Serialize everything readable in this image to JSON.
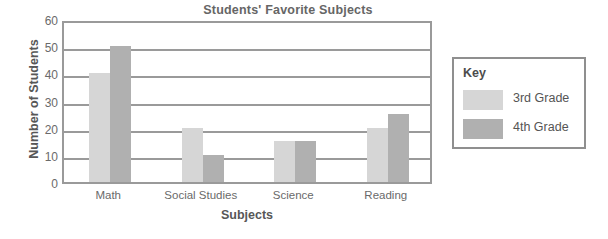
{
  "chart_data": {
    "type": "bar",
    "title": "Students' Favorite Subjects",
    "xlabel": "Subjects",
    "ylabel": "Number of Students",
    "categories": [
      "Math",
      "Social Studies",
      "Science",
      "Reading"
    ],
    "series": [
      {
        "name": "3rd Grade",
        "values": [
          40,
          20,
          15,
          20
        ],
        "color": "#d6d6d6"
      },
      {
        "name": "4th Grade",
        "values": [
          50,
          10,
          15,
          25
        ],
        "color": "#b0b0b0"
      }
    ],
    "ylim": [
      0,
      60
    ],
    "ytick_labels": [
      "60",
      "50",
      "40",
      "30",
      "20",
      "10",
      "0"
    ],
    "ytick_values": [
      60,
      50,
      40,
      30,
      20,
      10,
      0
    ],
    "grid": true,
    "legend_position": "right-outside"
  },
  "legend": {
    "title": "Key",
    "entries": [
      {
        "label": "3rd Grade",
        "color": "#d6d6d6"
      },
      {
        "label": "4th Grade",
        "color": "#b0b0b0"
      }
    ]
  }
}
